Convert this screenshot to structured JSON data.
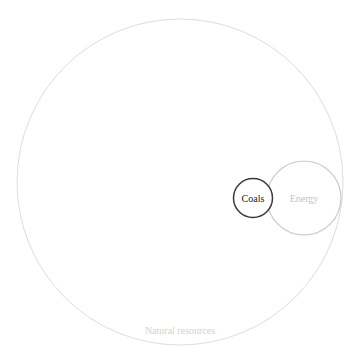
{
  "diagram": {
    "type": "circle-packing",
    "nodes": [
      {
        "id": "natural-resources",
        "label": "Natural resources",
        "cx": 180,
        "cy": 182,
        "r": 163,
        "stroke": "#dddddd",
        "text_color": "#d2d2d2",
        "label_x": 180,
        "label_y": 334,
        "font_size": 10
      },
      {
        "id": "energy",
        "label": "Energy",
        "cx": 304,
        "cy": 198,
        "r": 37,
        "stroke": "#c8c8c8",
        "text_color": "#c4c4c4",
        "label_x": 304,
        "label_y": 202,
        "font_size": 10
      },
      {
        "id": "coals",
        "label": "Coals",
        "cx": 253,
        "cy": 198,
        "r": 19.5,
        "stroke": "#3a3a3a",
        "text_color": "#222222",
        "label_x": 253,
        "label_y": 202,
        "font_size": 10
      }
    ]
  }
}
